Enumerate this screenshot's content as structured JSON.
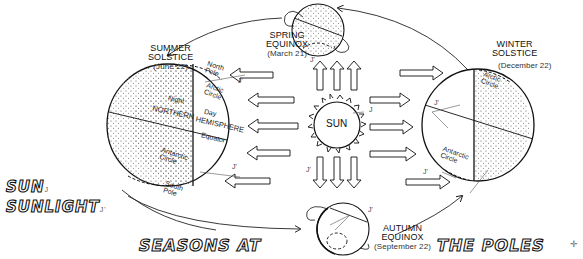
{
  "diagram": {
    "title_parts": [
      "SEASONS AT",
      "THE POLES"
    ],
    "side_words": [
      "SUN",
      "SUNLIGHT"
    ],
    "center": {
      "label": "SUN"
    },
    "positions": {
      "summer": {
        "name_line1": "SUMMER",
        "name_line2": "SOLSTICE",
        "date": "(June 22)"
      },
      "spring": {
        "name_line1": "SPRING",
        "name_line2": "EQUINOX",
        "date": "(March 21)"
      },
      "winter": {
        "name_line1": "WINTER",
        "name_line2": "SOLSTICE",
        "date": "(December 22)"
      },
      "autumn": {
        "name_line1": "AUTUMN",
        "name_line2": "EQUINOX",
        "date": "(September 22)"
      }
    },
    "summer_globe_labels": {
      "north_pole_1": "North",
      "north_pole_2": "Pole",
      "arctic_1": "Arctic",
      "arctic_2": "Circle",
      "night": "Night",
      "northern": "NORTHERN",
      "day": "Day",
      "hemisphere": "HEMISPHERE",
      "equator": "Equator",
      "antarctic_1": "Antarctic",
      "antarctic_2": "Circle",
      "south_pole_1": "South",
      "south_pole_2": "Pole"
    },
    "winter_globe_labels": {
      "arctic_1": "Arctic",
      "arctic_2": "Circle",
      "antarctic_1": "Antarctic",
      "antarctic_2": "Circle"
    },
    "marks": {
      "j": "J",
      "j_prime": "J'"
    },
    "colors": {
      "ink": "#111111",
      "paper": "#ffffff",
      "stipple": "#555555"
    }
  }
}
